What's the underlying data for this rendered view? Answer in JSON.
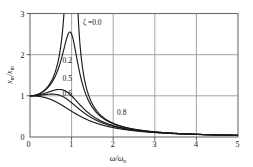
{
  "chart_data": {
    "type": "line",
    "title": "",
    "xlabel": "w/wn",
    "ylabel": "xm/xm",
    "xlim": [
      0,
      5
    ],
    "ylim": [
      0,
      3
    ],
    "xticks": [
      0,
      1,
      2,
      3,
      4,
      5
    ],
    "yticks": [
      0,
      1,
      2,
      3
    ],
    "grid": true,
    "legend_position": "inline-annotations",
    "series": [
      {
        "name": "zeta = 0.0",
        "label": "ζ = 0.0",
        "zeta": 0.0,
        "x": [
          0,
          0.2,
          0.4,
          0.5,
          0.6,
          0.7,
          0.75,
          0.8,
          0.85,
          0.9,
          0.92,
          0.95,
          1.05,
          1.08,
          1.12,
          1.18,
          1.25,
          1.35,
          1.5,
          1.75,
          2.0,
          2.5,
          3.0,
          3.5,
          4.0,
          4.5,
          5.0
        ],
        "y": [
          0,
          0.042,
          0.19,
          0.333,
          0.562,
          0.96,
          1.286,
          1.778,
          2.638,
          4.263,
          5.333,
          9.36,
          10.5,
          5.61,
          3.7,
          2.36,
          1.78,
          1.28,
          0.9,
          0.628,
          0.333,
          0.19,
          0.125,
          0.089,
          0.0667,
          0.052,
          0.042
        ]
      },
      {
        "name": "zeta = 0.2",
        "label": "0.2",
        "zeta": 0.2,
        "x": [
          0,
          0.2,
          0.4,
          0.6,
          0.7,
          0.8,
          0.85,
          0.9,
          0.95,
          0.98,
          1.0,
          1.05,
          1.1,
          1.2,
          1.3,
          1.5,
          1.75,
          2.0,
          2.5,
          3.0,
          3.5,
          4.0,
          4.5,
          5.0
        ],
        "y": [
          0,
          0.042,
          0.187,
          0.53,
          0.86,
          1.42,
          1.82,
          2.3,
          2.58,
          2.6,
          2.55,
          2.26,
          1.86,
          1.28,
          0.95,
          0.62,
          0.45,
          0.33,
          0.19,
          0.125,
          0.089,
          0.067,
          0.052,
          0.042
        ]
      },
      {
        "name": "zeta = 0.5",
        "label": "0.5",
        "zeta": 0.5,
        "x": [
          0,
          0.25,
          0.5,
          0.7,
          0.85,
          1.0,
          1.1,
          1.2,
          1.4,
          1.6,
          2.0,
          2.5,
          3.0,
          3.5,
          4.0,
          4.5,
          5.0
        ],
        "y": [
          0,
          0.066,
          0.28,
          0.56,
          0.8,
          1.0,
          1.03,
          1.0,
          0.86,
          0.7,
          0.47,
          0.31,
          0.22,
          0.16,
          0.12,
          0.096,
          0.078
        ]
      },
      {
        "name": "zeta = 0.6",
        "label": "0.6",
        "zeta": 0.6,
        "x": [
          0,
          0.3,
          0.6,
          0.9,
          1.1,
          1.2,
          1.3,
          1.5,
          1.8,
          2.2,
          2.6,
          3.0,
          3.5,
          4.0,
          4.5,
          5.0
        ],
        "y": [
          0,
          0.098,
          0.4,
          0.77,
          0.93,
          0.95,
          0.93,
          0.85,
          0.7,
          0.54,
          0.42,
          0.34,
          0.26,
          0.21,
          0.17,
          0.14
        ]
      },
      {
        "name": "zeta = 0.8",
        "label": "0.8",
        "zeta": 0.8,
        "x": [
          0,
          0.4,
          0.8,
          1.2,
          1.6,
          2.0,
          2.5,
          3.0,
          3.5,
          4.0,
          4.5,
          5.0
        ],
        "y": [
          0,
          0.15,
          0.5,
          0.76,
          0.78,
          0.72,
          0.62,
          0.52,
          0.44,
          0.37,
          0.32,
          0.28
        ]
      }
    ],
    "annotations": [
      {
        "text": "ζ = 0.0",
        "x": 1.25,
        "y": 2.82
      },
      {
        "text": "0.2",
        "x": 0.78,
        "y": 1.85
      },
      {
        "text": "0.5",
        "x": 0.78,
        "y": 1.42
      },
      {
        "text": "0.6",
        "x": 0.8,
        "y": 1.1
      },
      {
        "text": "0.8",
        "x": 2.1,
        "y": 0.58
      }
    ],
    "colors": {
      "curve": "#1a1a1a",
      "grid": "#9a9a9a",
      "frame": "#6e6e6e",
      "background": "#ffffff",
      "text": "#111111"
    }
  },
  "axes": {
    "x_tick_labels": [
      "0",
      "1",
      "2",
      "3",
      "4",
      "5"
    ],
    "y_tick_labels": [
      "0",
      "1",
      "2",
      "3"
    ],
    "x_axis_title_main": "ω/ω",
    "x_axis_title_sub": "n",
    "y_axis_title_num": "x",
    "y_axis_title_num_sub": "m",
    "y_axis_title_den": "x",
    "y_axis_title_den_sub": "m",
    "y_axis_title_slash": "/"
  },
  "curve_labels": {
    "zeta_symbol": "ζ",
    "l0": "ζ =0.0",
    "l1": "0.2",
    "l2": "0.5",
    "l3": "0.6",
    "l4": "0.8"
  }
}
